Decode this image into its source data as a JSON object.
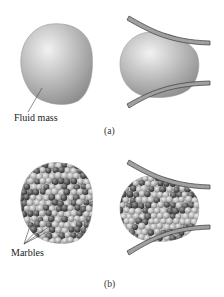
{
  "figure": {
    "panel_a": {
      "caption": "(a)",
      "label": "Fluid mass"
    },
    "panel_b": {
      "caption": "(b)",
      "label": "Marbles"
    }
  },
  "colors": {
    "fluid_light": "#e6e6e6",
    "fluid_mid": "#b8b8b8",
    "fluid_dark": "#8e8e8e",
    "wall_fill": "#9a9a9a",
    "wall_edge": "#3a3a3a",
    "marble_light": "#c8c8c8",
    "marble_dark": "#5a5a5a",
    "leader": "#444444"
  }
}
